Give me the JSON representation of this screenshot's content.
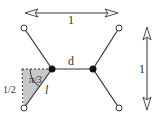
{
  "diagram": {
    "labels": {
      "width": "1",
      "height": "1",
      "edge_d": "d",
      "angle": "π/3",
      "half": "1/2",
      "edge_length": "l"
    },
    "colors": {
      "line": "#333333",
      "triangle_fill": "#c8c8c8",
      "node_fill": "#111111",
      "terminal_fill": "#ffffff"
    }
  }
}
